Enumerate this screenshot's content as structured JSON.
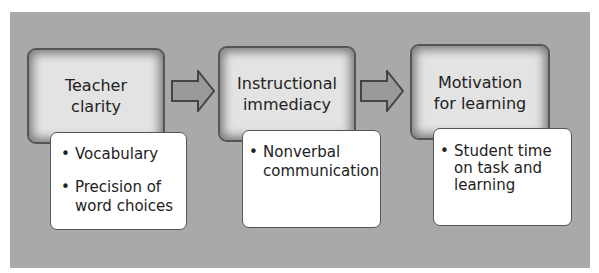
{
  "diagram": {
    "stages": [
      {
        "title": "Teacher\nclarity",
        "details": [
          "Vocabulary",
          "Precision of\nword choices"
        ]
      },
      {
        "title": "Instructional\nimmediacy",
        "details": [
          "Nonverbal\ncommunication"
        ]
      },
      {
        "title": "Motivation\nfor learning",
        "details": [
          "Student time\non task and\nlearning"
        ]
      }
    ],
    "bullet_glyph": "•",
    "colors": {
      "panel": "#a9a9a9",
      "stage_fill": "#e3e3e3",
      "detail_fill": "#ffffff",
      "arrow_fill": "#999999",
      "outline": "#444444"
    }
  }
}
